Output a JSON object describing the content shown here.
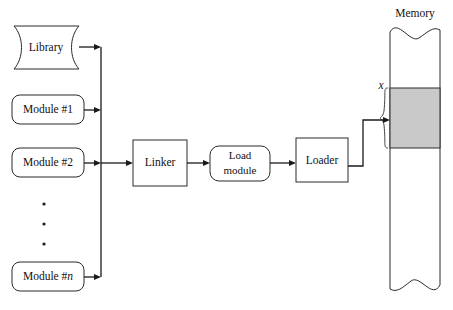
{
  "diagram": {
    "colors": {
      "stroke": "#2b2b2b",
      "connector": "#1a1a1a",
      "memory_block_fill": "#c9c9c9",
      "background": "#ffffff"
    },
    "inputs": {
      "library_label": "Library",
      "modules": [
        {
          "label": "Module #1"
        },
        {
          "label": "Module #2"
        },
        {
          "label": "Module #",
          "italic_suffix": "n"
        }
      ],
      "ellipsis": "⋮"
    },
    "stages": {
      "linker_label": "Linker",
      "load_module_line1": "Load",
      "load_module_line2": "module",
      "loader_label": "Loader"
    },
    "memory": {
      "title": "Memory",
      "address_label": "x",
      "block_description": "loaded module region"
    }
  }
}
